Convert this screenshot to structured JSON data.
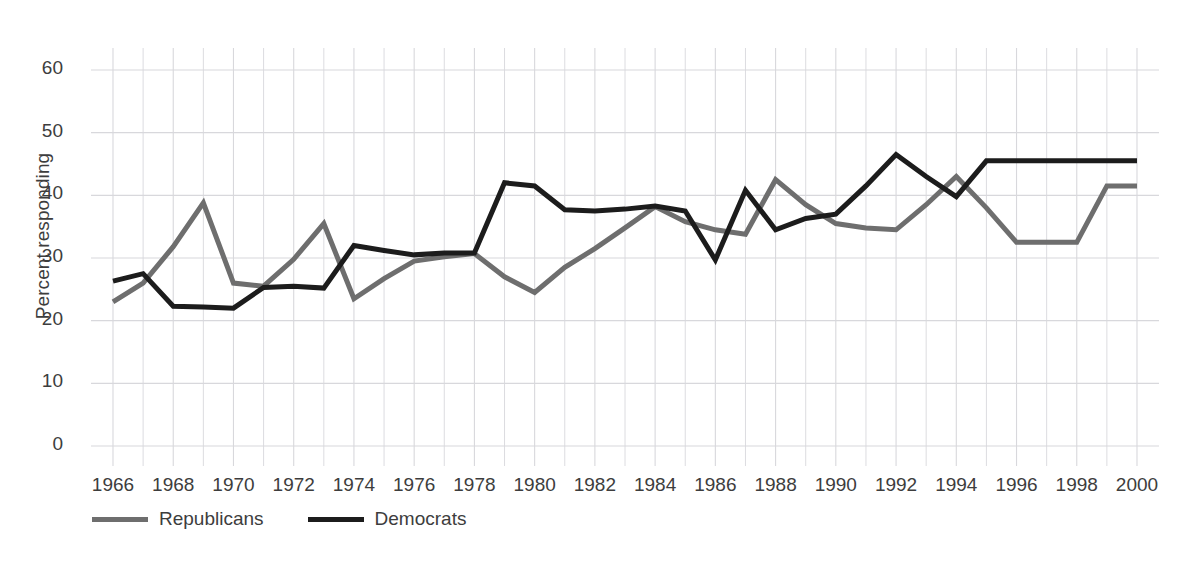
{
  "figure": {
    "clipped_caption_top": "",
    "background_color": "#ffffff"
  },
  "axes": {
    "y_axis_title": "Percent responding",
    "y_ticks": [
      "0",
      "10",
      "20",
      "30",
      "40",
      "50",
      "60"
    ],
    "x_ticks": [
      "1966",
      "1968",
      "1970",
      "1972",
      "1974",
      "1976",
      "1978",
      "1980",
      "1982",
      "1984",
      "1986",
      "1988",
      "1990",
      "1992",
      "1994",
      "1996",
      "1998",
      "2000"
    ],
    "grid": "both",
    "grid_color": "#d8d8dc"
  },
  "legend": {
    "position": "below-axis-left",
    "items": [
      {
        "label": "Republicans",
        "color": "#6e6e6e"
      },
      {
        "label": "Democrats",
        "color": "#1c1c1c"
      }
    ]
  },
  "chart_data": {
    "type": "line",
    "title": "",
    "subtitle": "",
    "xlabel": "",
    "ylabel": "Percent responding",
    "xlim": [
      1966,
      2000
    ],
    "ylim": [
      0,
      60
    ],
    "yticks": [
      0,
      10,
      20,
      30,
      40,
      50,
      60
    ],
    "xticks": [
      1966,
      1968,
      1970,
      1972,
      1974,
      1976,
      1978,
      1980,
      1982,
      1984,
      1986,
      1988,
      1990,
      1992,
      1994,
      1996,
      1998,
      2000
    ],
    "grid": true,
    "legend_position": "bottom-left",
    "x": [
      1966,
      1967,
      1968,
      1969,
      1970,
      1971,
      1972,
      1973,
      1974,
      1975,
      1976,
      1977,
      1978,
      1979,
      1980,
      1981,
      1982,
      1983,
      1984,
      1985,
      1986,
      1987,
      1988,
      1989,
      1990,
      1991,
      1992,
      1993,
      1994,
      1995,
      1996,
      1997,
      1998,
      1999,
      2000
    ],
    "series": [
      {
        "name": "Republicans",
        "color": "#6e6e6e",
        "values": [
          23.0,
          26.0,
          31.8,
          38.8,
          26.0,
          25.5,
          29.8,
          35.5,
          23.5,
          26.7,
          29.5,
          30.2,
          30.7,
          27.0,
          24.5,
          28.5,
          31.5,
          34.8,
          38.2,
          35.8,
          34.5,
          33.8,
          42.5,
          38.5,
          35.5,
          34.8,
          34.5,
          38.5,
          43.0,
          38.0,
          32.5,
          32.5,
          32.5,
          41.5,
          41.5
        ]
      },
      {
        "name": "Democrats",
        "color": "#1c1c1c",
        "values": [
          26.3,
          27.5,
          22.3,
          22.2,
          22.0,
          25.3,
          25.5,
          25.2,
          32.0,
          31.2,
          30.5,
          30.8,
          30.8,
          42.0,
          41.5,
          37.7,
          37.5,
          37.8,
          38.3,
          37.5,
          29.7,
          40.8,
          34.5,
          36.3,
          37.0,
          41.5,
          46.5,
          43.0,
          39.8,
          45.5,
          45.5,
          45.5,
          45.5,
          45.5,
          45.5
        ]
      }
    ]
  }
}
